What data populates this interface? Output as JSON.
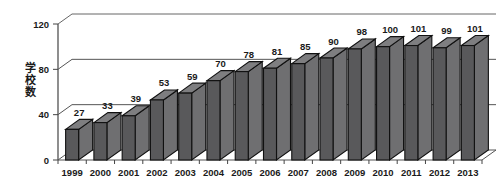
{
  "chart_data": {
    "type": "bar",
    "title": "",
    "subtitle": "",
    "xlabel": "",
    "ylabel": "学校数",
    "categories": [
      "1999",
      "2000",
      "2001",
      "2002",
      "2003",
      "2004",
      "2005",
      "2006",
      "2007",
      "2008",
      "2009",
      "2010",
      "2011",
      "2012",
      "2013"
    ],
    "values": [
      27,
      33,
      39,
      53,
      59,
      70,
      78,
      81,
      85,
      90,
      98,
      100,
      101,
      99,
      101
    ],
    "series": [
      {
        "name": "学校数",
        "values": [
          27,
          33,
          39,
          53,
          59,
          70,
          78,
          81,
          85,
          90,
          98,
          100,
          101,
          99,
          101
        ]
      }
    ],
    "data_labels": [
      "27",
      "33",
      "39",
      "53",
      "59",
      "70",
      "78",
      "81",
      "85",
      "90",
      "98",
      "100",
      "101",
      "99",
      "101"
    ],
    "ylim": [
      0,
      120
    ],
    "yticks": [
      0,
      40,
      80,
      120
    ],
    "ytick_labels": [
      "0",
      "40",
      "80",
      "120"
    ],
    "grid": true,
    "grid_axis": "y",
    "legend": false,
    "legend_position": "none",
    "style": "3d-column",
    "bar_color": "#59595b",
    "bar_side_color": "#6f6f71",
    "bar_top_color": "#7e7e80",
    "bar_outline_color": "#111111",
    "background_color": "#ffffff",
    "grid_color": "#555555",
    "axis_color": "#444444",
    "text_color": "#1a1a1a"
  }
}
